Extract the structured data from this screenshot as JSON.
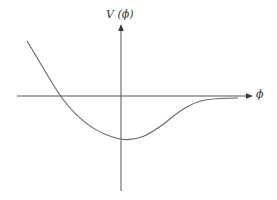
{
  "diagram": {
    "y_axis_label": "V (ϕ)",
    "x_axis_label": "ϕ",
    "colors": {
      "axis": "#555555",
      "curve": "#666666",
      "text": "#333333",
      "background": "#ffffff"
    },
    "axes": {
      "x_axis": {
        "x1": 17,
        "y": 96,
        "x2": 252
      },
      "y_axis": {
        "x": 121,
        "y1": 191,
        "y2": 25
      }
    },
    "curve_points": [
      [
        27,
        41
      ],
      [
        45,
        70
      ],
      [
        60,
        96
      ],
      [
        80,
        118
      ],
      [
        100,
        133
      ],
      [
        120,
        139
      ],
      [
        140,
        136
      ],
      [
        160,
        127
      ],
      [
        185,
        108
      ],
      [
        200,
        101
      ],
      [
        220,
        98.5
      ],
      [
        238,
        98
      ]
    ]
  }
}
